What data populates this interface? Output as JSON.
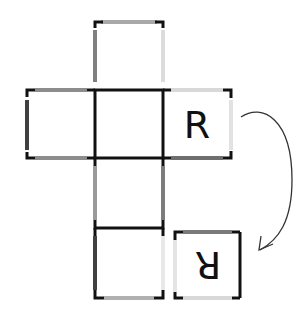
{
  "diagram": {
    "faces": [
      {
        "id": "top",
        "x": 95,
        "y": 22,
        "label": ""
      },
      {
        "id": "left",
        "x": 27,
        "y": 90,
        "label": ""
      },
      {
        "id": "center",
        "x": 95,
        "y": 90,
        "label": ""
      },
      {
        "id": "right",
        "x": 163,
        "y": 90,
        "label": "R"
      },
      {
        "id": "lower",
        "x": 95,
        "y": 158,
        "label": ""
      },
      {
        "id": "bottom",
        "x": 95,
        "y": 228,
        "label": ""
      }
    ],
    "folded_face": {
      "x": 175,
      "y": 232,
      "label": "R",
      "rotation": 180
    },
    "arrow": {
      "description": "curved arrow from face R to rotated face R"
    },
    "colors": {
      "black": "#111111",
      "very_dark": "#404040",
      "dark": "#707070",
      "mid": "#909090",
      "light": "#d8d8d8",
      "very_light": "#e8e8e8"
    }
  }
}
